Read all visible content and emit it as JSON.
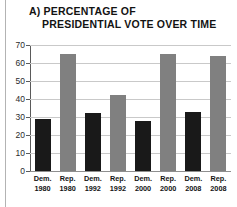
{
  "figure": {
    "label": "a)",
    "title_line1": "a) PERCENTAGE OF",
    "title_line2": "PRESIDENTIAL VOTE OVER TIME"
  },
  "colors": {
    "democrat_bar": "#191919",
    "republican_bar": "#808080",
    "gridline": "#c9c9c9",
    "axis": "#5a5a5a",
    "text": "#131313",
    "background": "#ffffff"
  },
  "chart_data": {
    "type": "bar",
    "title": "a) PERCENTAGE OF PRESIDENTIAL VOTE OVER TIME",
    "xlabel": "",
    "ylabel": "",
    "ylim": [
      0,
      70
    ],
    "yticks": [
      0,
      10,
      20,
      30,
      40,
      50,
      60,
      70
    ],
    "ytick_labels": [
      "0",
      "10",
      "20",
      "30",
      "40",
      "50",
      "60",
      "70"
    ],
    "grid": true,
    "legend": false,
    "categories": [
      "Dem. 1980",
      "Rep. 1980",
      "Dem. 1992",
      "Rep. 1992",
      "Dem. 2000",
      "Rep. 2000",
      "Dem. 2008",
      "Rep. 2008"
    ],
    "values": [
      29,
      65,
      32,
      42,
      28,
      65,
      33,
      64
    ],
    "bars": [
      {
        "party": "Dem.",
        "year": "1980",
        "value": 29,
        "color": "#191919"
      },
      {
        "party": "Rep.",
        "year": "1980",
        "value": 65,
        "color": "#808080"
      },
      {
        "party": "Dem.",
        "year": "1992",
        "value": 32,
        "color": "#191919"
      },
      {
        "party": "Rep.",
        "year": "1992",
        "value": 42,
        "color": "#808080"
      },
      {
        "party": "Dem.",
        "year": "2000",
        "value": 28,
        "color": "#191919"
      },
      {
        "party": "Rep.",
        "year": "2000",
        "value": 65,
        "color": "#808080"
      },
      {
        "party": "Dem.",
        "year": "2008",
        "value": 33,
        "color": "#191919"
      },
      {
        "party": "Rep.",
        "year": "2008",
        "value": 64,
        "color": "#808080"
      }
    ]
  }
}
